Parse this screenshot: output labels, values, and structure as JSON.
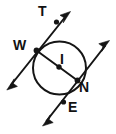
{
  "figure": {
    "type": "geometry-diagram",
    "background_color": "#ffffff",
    "ink_color": "#151515",
    "width": 116,
    "height": 134
  },
  "labels": {
    "T": "T",
    "W": "W",
    "I": "I",
    "N": "N",
    "E": "E"
  },
  "geometry": {
    "circle": {
      "cx": 59.5,
      "cy": 68,
      "r": 26.5
    },
    "points": [
      {
        "name": "W",
        "x": 36.5,
        "y": 50.5
      },
      {
        "name": "I",
        "x": 59.0,
        "y": 67.0
      },
      {
        "name": "N",
        "x": 77.5,
        "y": 80.5
      },
      {
        "name": "T",
        "x": 56.5,
        "y": 22.0
      },
      {
        "name": "E",
        "x": 63.5,
        "y": 102.0
      }
    ],
    "chord": {
      "x1": 36.5,
      "y1": 50.5,
      "x2": 77.5,
      "y2": 80.5
    },
    "ray_T": {
      "x1": 8.0,
      "y1": 89.0,
      "x2": 69.5,
      "y2": 12.5
    },
    "ray_E": {
      "x1": 43.5,
      "y1": 125.0,
      "x2": 109.0,
      "y2": 41.0
    }
  }
}
